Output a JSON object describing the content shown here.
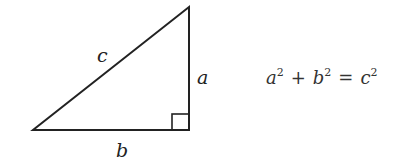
{
  "diagram": {
    "labels": {
      "hypotenuse": "c",
      "vertical_leg": "a",
      "horizontal_leg": "b"
    },
    "equation": {
      "term1_base": "a",
      "term1_exp": "2",
      "plus": "+",
      "term2_base": "b",
      "term2_exp": "2",
      "equals": "=",
      "term3_base": "c",
      "term3_exp": "2"
    }
  }
}
